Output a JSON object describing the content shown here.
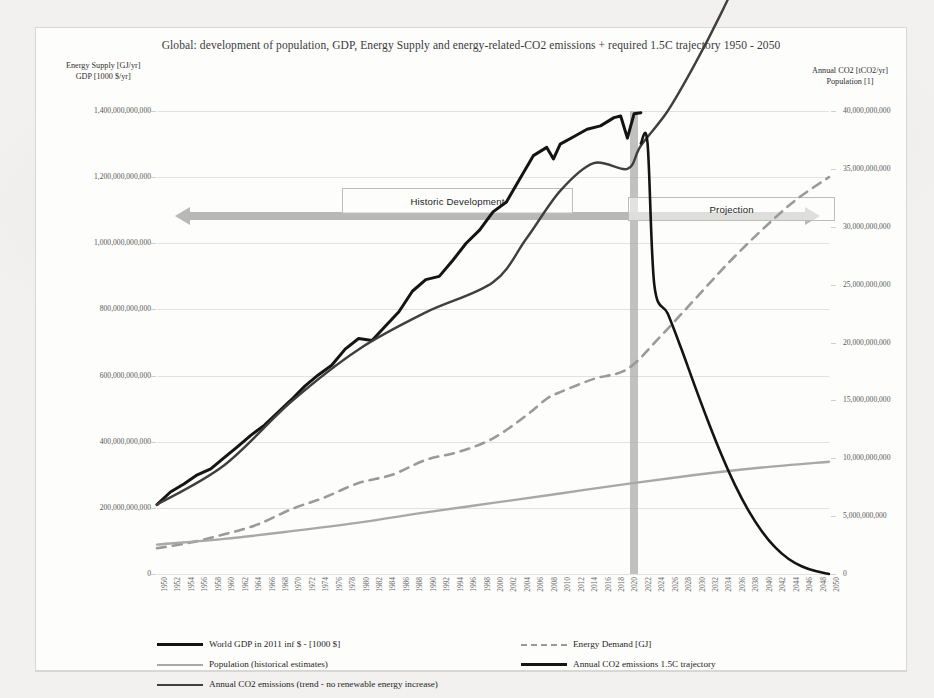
{
  "chart_data": {
    "type": "line",
    "title": "Global: development of population, GDP, Energy Supply and energy-related-CO2 emissions + required 1.5C trajectory 1950 - 2050",
    "xlabel": "",
    "ylabel_left_line1": "Energy Supply  [GJ/yr]",
    "ylabel_left_line2": "GDP [1000 $/yr]",
    "ylabel_right_line1": "Annual CO2 [tCO2/yr]",
    "ylabel_right_line2": "Population [1]",
    "grid": true,
    "legend_position": "bottom",
    "xlim": [
      1950,
      2050
    ],
    "x_tick_step": 2,
    "ylim_left": [
      0,
      1400000000000
    ],
    "ylim_right": [
      0,
      40000000000
    ],
    "y_ticks_left": [
      "0",
      "200,000,000,000",
      "400,000,000,000",
      "600,000,000,000",
      "800,000,000,000",
      "1,000,000,000,000",
      "1,200,000,000,000",
      "1,400,000,000,000"
    ],
    "y_ticks_right": [
      "0",
      "5,000,000,000",
      "10,000,000,000",
      "15,000,000,000",
      "20,000,000,000",
      "25,000,000,000",
      "30,000,000,000",
      "35,000,000,000",
      "40,000,000,000"
    ],
    "x_tick_labels": [
      "1950",
      "1952",
      "1954",
      "1956",
      "1958",
      "1960",
      "1962",
      "1964",
      "1966",
      "1968",
      "1970",
      "1972",
      "1974",
      "1976",
      "1978",
      "1980",
      "1982",
      "1984",
      "1986",
      "1988",
      "1990",
      "1992",
      "1994",
      "1996",
      "1998",
      "2000",
      "2002",
      "2004",
      "2006",
      "2008",
      "2010",
      "2012",
      "2014",
      "2016",
      "2018",
      "2020",
      "2022",
      "2024",
      "2026",
      "2028",
      "2030",
      "2032",
      "2034",
      "2036",
      "2038",
      "2040",
      "2042",
      "2044",
      "2046",
      "2048",
      "2050"
    ],
    "annotations": [
      {
        "name": "historic-development",
        "label": "Historic Development"
      },
      {
        "name": "projection",
        "label": "Projection"
      },
      {
        "name": "present-day-band",
        "label": "",
        "year": 2021
      }
    ],
    "series": [
      {
        "name": "World GDP in 2011 int $ - [1000 $]",
        "axis": "left",
        "style": "solid",
        "color": "#141414",
        "width": 3,
        "x": [
          1950,
          1952,
          1954,
          1956,
          1958,
          1960,
          1962,
          1964,
          1966,
          1968,
          1970,
          1972,
          1974,
          1976,
          1978,
          1980,
          1982,
          1984,
          1986,
          1988,
          1990,
          1992,
          1994,
          1996,
          1998,
          2000,
          2002,
          2004,
          2006,
          2008,
          2009,
          2010,
          2012,
          2014,
          2016,
          2018,
          2019,
          2020,
          2021,
          2022
        ],
        "values": [
          210000000000,
          248000000000,
          272000000000,
          300000000000,
          318000000000,
          352000000000,
          385000000000,
          420000000000,
          450000000000,
          489000000000,
          527000000000,
          568000000000,
          602000000000,
          631000000000,
          680000000000,
          712000000000,
          706000000000,
          750000000000,
          793000000000,
          855000000000,
          890000000000,
          900000000000,
          948000000000,
          1000000000000,
          1040000000000,
          1095000000000,
          1125000000000,
          1195000000000,
          1265000000000,
          1290000000000,
          1255000000000,
          1300000000000,
          1322000000000,
          1345000000000,
          1355000000000,
          1380000000000,
          1385000000000,
          1318000000000,
          1392000000000,
          1395000000000
        ]
      },
      {
        "name": "Energy Demand [GJ]",
        "axis": "left",
        "style": "dashed",
        "color": "#9a9a98",
        "width": 2.6,
        "x": [
          1950,
          1955,
          1960,
          1965,
          1970,
          1975,
          1980,
          1985,
          1990,
          1995,
          2000,
          2005,
          2008,
          2010,
          2015,
          2020,
          2025,
          2030,
          2035,
          2040,
          2045,
          2050
        ],
        "values": [
          78000000000,
          95000000000,
          120000000000,
          150000000000,
          196000000000,
          232000000000,
          275000000000,
          300000000000,
          345000000000,
          370000000000,
          410000000000,
          480000000000,
          530000000000,
          550000000000,
          590000000000,
          620000000000,
          720000000000,
          830000000000,
          940000000000,
          1040000000000,
          1130000000000,
          1200000000000
        ]
      },
      {
        "name": "Population (historical estimates)",
        "axis": "right",
        "style": "solid",
        "color": "#a8a8a6",
        "width": 2.4,
        "x": [
          1950,
          1960,
          1970,
          1980,
          1990,
          2000,
          2010,
          2020,
          2030,
          2040,
          2050
        ],
        "values": [
          2540000000,
          3030000000,
          3700000000,
          4440000000,
          5320000000,
          6140000000,
          6960000000,
          7790000000,
          8550000000,
          9200000000,
          9700000000
        ]
      },
      {
        "name": "Annual CO2 emissions (trend - no renewable energy increase)",
        "axis": "right",
        "style": "solid",
        "color": "#3f3f3f",
        "width": 2.4,
        "x": [
          1950,
          1960,
          1970,
          1980,
          1990,
          2000,
          2005,
          2010,
          2015,
          2020,
          2022,
          2026,
          2030,
          2034,
          2038,
          2042,
          2046,
          2050
        ],
        "values": [
          6000000000,
          9400000000,
          14900000000,
          19400000000,
          22600000000,
          25200000000,
          29000000000,
          33100000000,
          35500000000,
          35000000000,
          37000000000,
          40000000000,
          44000000000,
          48500000000,
          53500000000,
          59000000000,
          65000000000,
          71000000000
        ]
      },
      {
        "name": "Annual CO2 emissions 1.5C trajectory",
        "axis": "right",
        "style": "solid",
        "color": "#141414",
        "width": 2.6,
        "x": [
          2022,
          2023,
          2024,
          2026,
          2028,
          2030,
          2032,
          2034,
          2036,
          2038,
          2040,
          2042,
          2044,
          2046,
          2048,
          2050
        ],
        "values": [
          37200000000,
          37200000000,
          25000000000,
          22500000000,
          19500000000,
          16300000000,
          13200000000,
          10300000000,
          7700000000,
          5500000000,
          3700000000,
          2300000000,
          1300000000,
          650000000,
          250000000,
          0
        ]
      }
    ]
  },
  "legend": {
    "items": [
      {
        "label": "World GDP in 2011 inf $ - [1000 $]",
        "swatch": "solid-black"
      },
      {
        "label": "Population (historical estimates)",
        "swatch": "solid-gray"
      },
      {
        "label": "Annual CO2 emissions (trend - no renewable energy increase)",
        "swatch": "solid-mid"
      },
      {
        "label": "Energy Demand [GJ]",
        "swatch": "dash"
      },
      {
        "label": "Annual CO2 emissions 1.5C trajectory",
        "swatch": "solid-black"
      }
    ]
  },
  "colors": {
    "gdp": "#141414",
    "energy_demand": "#9a9a98",
    "population": "#a8a8a6",
    "co2_trend": "#3f3f3f",
    "co2_15c": "#141414",
    "band": "#a9a9a9",
    "grid": "#e2e2e0",
    "page_bg": "#f2f1ef",
    "card_bg": "#fdfdfc"
  }
}
